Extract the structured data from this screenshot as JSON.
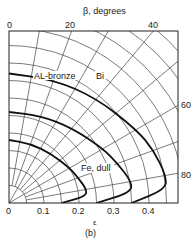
{
  "chart_data": {
    "type": "polar-line",
    "title": "",
    "caption": "(b)",
    "top_axis_label": "β, degrees",
    "xlabel": "ε",
    "x_ticks": [
      "0",
      "0.1",
      "0.2",
      "0.3",
      "0.4"
    ],
    "top_ticks": [
      "0",
      "20",
      "40"
    ],
    "right_ticks": [
      "60",
      "80"
    ],
    "xlim": [
      0,
      0.48
    ],
    "angle_range_deg": [
      0,
      90
    ],
    "grid": true,
    "series": [
      {
        "name": "Fe, dull",
        "beta_deg": [
          0,
          20,
          40,
          60,
          70,
          80,
          85,
          90
        ],
        "epsilon": [
          0.18,
          0.18,
          0.185,
          0.2,
          0.21,
          0.225,
          0.22,
          0.15
        ]
      },
      {
        "name": "AL-bronze",
        "beta_deg": [
          0,
          20,
          40,
          60,
          70,
          80,
          85,
          90
        ],
        "epsilon": [
          0.26,
          0.265,
          0.28,
          0.31,
          0.33,
          0.355,
          0.35,
          0.25
        ]
      },
      {
        "name": "Bi",
        "beta_deg": [
          0,
          20,
          40,
          60,
          70,
          80,
          85,
          90
        ],
        "epsilon": [
          0.37,
          0.375,
          0.39,
          0.42,
          0.44,
          0.455,
          0.45,
          0.35
        ]
      }
    ]
  },
  "labels": {
    "top_axis": "β, degrees",
    "x_axis": "ε",
    "caption": "(b)",
    "curve_fe": "Fe, dull",
    "curve_al": "AL-bronze",
    "curve_bi": "Bi",
    "tick_top_0": "0",
    "tick_top_20": "20",
    "tick_top_40": "40",
    "tick_right_60": "60",
    "tick_right_80": "80",
    "tick_x_0": "0",
    "tick_x_1": "0.1",
    "tick_x_2": "0.2",
    "tick_x_3": "0.3",
    "tick_x_4": "0.4"
  }
}
